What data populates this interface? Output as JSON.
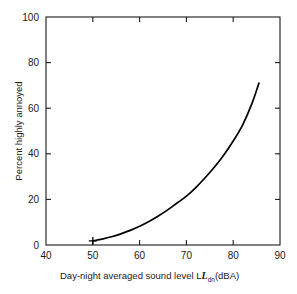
{
  "chart_data": {
    "type": "line",
    "title": "",
    "xlabel": "Day-night averaged sound level L",
    "xlabel_sub": "dn",
    "xlabel_tail": "(dBA)",
    "ylabel": "Percent highly annoyed",
    "xlim": [
      40,
      90
    ],
    "ylim": [
      0,
      100
    ],
    "xticks": [
      40,
      50,
      60,
      70,
      80,
      90
    ],
    "xtick_labels": [
      "40",
      "50",
      "60",
      "70",
      "80",
      "90"
    ],
    "yticks": [
      0,
      20,
      40,
      60,
      80,
      100
    ],
    "ytick_labels": [
      "0",
      "20",
      "40",
      "60",
      "80",
      "100"
    ],
    "grid": false,
    "legend": "none",
    "series": [
      {
        "name": "Percent highly annoyed",
        "x": [
          50,
          52,
          54,
          56,
          58,
          60,
          62,
          64,
          66,
          68,
          70,
          72,
          74,
          76,
          78,
          80,
          82,
          84,
          85.5
        ],
        "y": [
          1.8,
          2.6,
          3.6,
          4.9,
          6.4,
          8.2,
          10.3,
          12.7,
          15.4,
          18.4,
          21.4,
          25.2,
          29.5,
          34.2,
          39.5,
          45.6,
          52.6,
          62.0,
          71.0
        ]
      }
    ],
    "markers": [
      {
        "name": "start-marker",
        "shape": "plus",
        "x": 50,
        "y": 1.8
      }
    ],
    "colors": {
      "curve": "#000000",
      "axis": "#1a1a1a",
      "background": "#ffffff"
    }
  }
}
